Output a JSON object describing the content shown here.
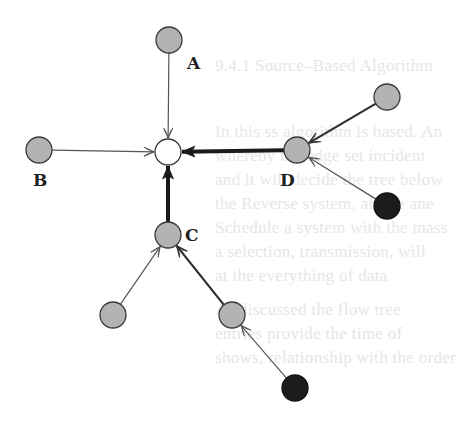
{
  "diagram": {
    "type": "directed-graph",
    "colors": {
      "gray_node": "#b3b3b3",
      "black_node": "#1c1c1c",
      "white_node": "#ffffff",
      "stroke": "#3a3a3a",
      "thin_edge": "#555555",
      "thick_edge": "#1a1a1a"
    },
    "nodes": [
      {
        "id": "center",
        "label": "",
        "kind": "white",
        "x": 168,
        "y": 152
      },
      {
        "id": "A",
        "label": "A",
        "kind": "gray",
        "x": 169,
        "y": 40,
        "label_x": 187,
        "label_y": 69
      },
      {
        "id": "B",
        "label": "B",
        "kind": "gray",
        "x": 39,
        "y": 150,
        "label_x": 33,
        "label_y": 186
      },
      {
        "id": "C",
        "label": "C",
        "kind": "gray",
        "x": 168,
        "y": 235,
        "label_x": 185,
        "label_y": 241
      },
      {
        "id": "D",
        "label": "D",
        "kind": "gray",
        "x": 297,
        "y": 150,
        "label_x": 280,
        "label_y": 186
      },
      {
        "id": "D_in_gray",
        "label": "",
        "kind": "gray",
        "x": 387,
        "y": 97
      },
      {
        "id": "D_in_black",
        "label": "",
        "kind": "black",
        "x": 387,
        "y": 206
      },
      {
        "id": "C_in_left",
        "label": "",
        "kind": "gray",
        "x": 113,
        "y": 315
      },
      {
        "id": "C_in_right",
        "label": "",
        "kind": "gray",
        "x": 232,
        "y": 315
      },
      {
        "id": "bottom_black",
        "label": "",
        "kind": "black",
        "x": 295,
        "y": 388
      }
    ],
    "edges": [
      {
        "from": "A",
        "to": "center",
        "weight": "thin"
      },
      {
        "from": "B",
        "to": "center",
        "weight": "thin"
      },
      {
        "from": "D",
        "to": "center",
        "weight": "thick"
      },
      {
        "from": "C",
        "to": "center",
        "weight": "thick"
      },
      {
        "from": "D_in_gray",
        "to": "D",
        "weight": "medium"
      },
      {
        "from": "D_in_black",
        "to": "D",
        "weight": "thin"
      },
      {
        "from": "C_in_left",
        "to": "C",
        "weight": "thin"
      },
      {
        "from": "C_in_right",
        "to": "C",
        "weight": "medium"
      },
      {
        "from": "bottom_black",
        "to": "C_in_right",
        "weight": "thin"
      }
    ],
    "labels": {
      "A": "A",
      "B": "B",
      "C": "C",
      "D": "D"
    }
  }
}
